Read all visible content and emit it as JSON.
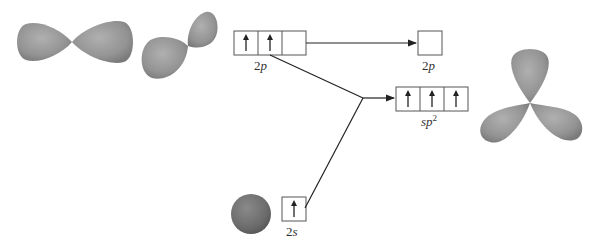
{
  "diagram": {
    "colors": {
      "orbital_lobe": "#8f8f8f",
      "orbital_lobe_light": "#b5b5b5",
      "orbital_lobe_dark": "#6f6f6f",
      "line": "#222222",
      "box_border": "#555555"
    },
    "boxes": {
      "left_2p": {
        "label_num": "2",
        "label_sym": "p",
        "cells": [
          "up",
          "up",
          "empty"
        ]
      },
      "right_2p": {
        "label_num": "2",
        "label_sym": "p",
        "cells": [
          "empty"
        ]
      },
      "sp2": {
        "label_sym": "sp",
        "label_sup": "2",
        "cells": [
          "up",
          "up",
          "up"
        ]
      },
      "s2": {
        "label_num": "2",
        "label_sym": "s",
        "cells": [
          "up"
        ]
      }
    },
    "orbitals": [
      {
        "name": "p-orbital-horizontal"
      },
      {
        "name": "p-orbital-tilted"
      },
      {
        "name": "s-orbital-sphere"
      },
      {
        "name": "sp2-trigonal-orbitals"
      }
    ]
  }
}
